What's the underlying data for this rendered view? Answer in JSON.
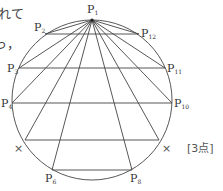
{
  "text_fragments": {
    "line1": "れて",
    "line2": "っ，"
  },
  "score_label": "[3点]",
  "diagram": {
    "circle": {
      "cx": 92,
      "cy": 100,
      "r": 80
    },
    "points": {
      "P1": {
        "label": "P",
        "sub": "1",
        "x": 92,
        "y": 20
      },
      "P2": {
        "label": "P",
        "sub": "2",
        "x": 45,
        "y": 34
      },
      "P3": {
        "label": "P",
        "sub": "3",
        "x": 19,
        "y": 68
      },
      "P4": {
        "label": "P",
        "sub": "4",
        "x": 12,
        "y": 103
      },
      "X_left": {
        "label": "×",
        "x": 25,
        "y": 140
      },
      "P6": {
        "label": "P",
        "sub": "6",
        "x": 52,
        "y": 170
      },
      "P8": {
        "label": "P",
        "sub": "8",
        "x": 132,
        "y": 170
      },
      "X_right": {
        "label": "×",
        "x": 159,
        "y": 140
      },
      "P10": {
        "label": "P",
        "sub": "10",
        "x": 172,
        "y": 103
      },
      "P11": {
        "label": "P",
        "sub": "11",
        "x": 165,
        "y": 68
      },
      "P12": {
        "label": "P",
        "sub": "12",
        "x": 139,
        "y": 34
      }
    },
    "chords": [
      [
        "P2",
        "P12"
      ],
      [
        "P3",
        "P11"
      ],
      [
        "P4",
        "P10"
      ],
      [
        "X_left",
        "X_right"
      ],
      [
        "P6",
        "P8"
      ]
    ],
    "fan_from_P1": [
      "P2",
      "P3",
      "P4",
      "X_left",
      "P6",
      "P8",
      "X_right",
      "P10",
      "P11",
      "P12"
    ]
  }
}
